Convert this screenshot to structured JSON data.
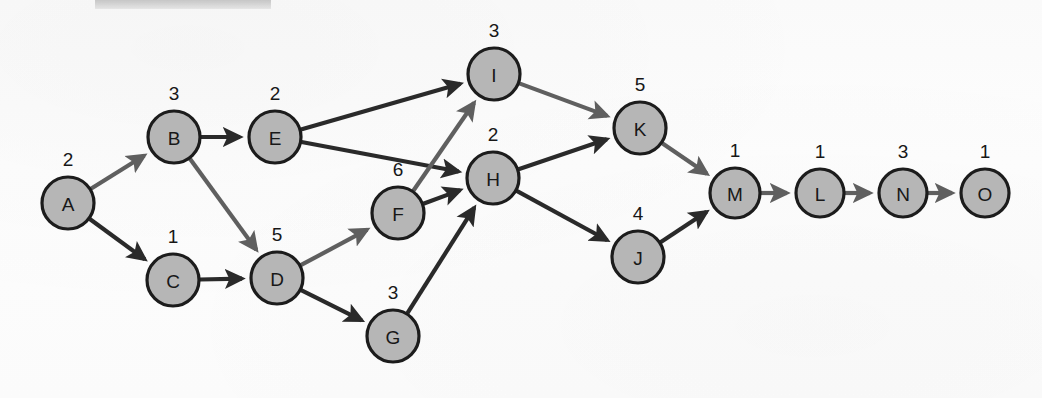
{
  "figure": {
    "background_color": "#fbfbfb",
    "node_fill_color": "#b6b6b6",
    "node_stroke_color": "#1c1c1c",
    "edge_color": "#2a2a2a",
    "edge_color_light": "#5f5f5f"
  },
  "chart_data": {
    "type": "diagram",
    "subtype": "directed-graph",
    "title": "",
    "nodes": [
      {
        "id": "A",
        "label": "A",
        "weight": "2",
        "x": 68,
        "y": 203,
        "r": 26
      },
      {
        "id": "B",
        "label": "B",
        "weight": "3",
        "x": 174,
        "y": 137,
        "r": 26
      },
      {
        "id": "C",
        "label": "C",
        "weight": "1",
        "x": 173,
        "y": 280,
        "r": 26
      },
      {
        "id": "D",
        "label": "D",
        "weight": "5",
        "x": 277,
        "y": 278,
        "r": 26
      },
      {
        "id": "E",
        "label": "E",
        "weight": "2",
        "x": 275,
        "y": 137,
        "r": 26
      },
      {
        "id": "F",
        "label": "F",
        "weight": "6",
        "x": 398,
        "y": 213,
        "r": 26
      },
      {
        "id": "G",
        "label": "G",
        "weight": "3",
        "x": 393,
        "y": 336,
        "r": 26
      },
      {
        "id": "H",
        "label": "H",
        "weight": "2",
        "x": 493,
        "y": 178,
        "r": 26
      },
      {
        "id": "I",
        "label": "I",
        "weight": "3",
        "x": 494,
        "y": 74,
        "r": 26
      },
      {
        "id": "J",
        "label": "J",
        "weight": "4",
        "x": 638,
        "y": 257,
        "r": 26
      },
      {
        "id": "K",
        "label": "K",
        "weight": "5",
        "x": 640,
        "y": 128,
        "r": 26
      },
      {
        "id": "L",
        "label": "L",
        "weight": "1",
        "x": 820,
        "y": 193,
        "r": 24
      },
      {
        "id": "M",
        "label": "M",
        "weight": "1",
        "x": 735,
        "y": 193,
        "r": 25
      },
      {
        "id": "N",
        "label": "N",
        "weight": "3",
        "x": 903,
        "y": 193,
        "r": 24
      },
      {
        "id": "O",
        "label": "O",
        "weight": "1",
        "x": 985,
        "y": 193,
        "r": 24
      }
    ],
    "edges": [
      {
        "from": "A",
        "to": "B",
        "style": "light"
      },
      {
        "from": "A",
        "to": "C",
        "style": "dark"
      },
      {
        "from": "B",
        "to": "E",
        "style": "dark"
      },
      {
        "from": "B",
        "to": "D",
        "style": "light"
      },
      {
        "from": "C",
        "to": "D",
        "style": "dark"
      },
      {
        "from": "D",
        "to": "F",
        "style": "light"
      },
      {
        "from": "D",
        "to": "G",
        "style": "dark"
      },
      {
        "from": "E",
        "to": "I",
        "style": "dark"
      },
      {
        "from": "E",
        "to": "H",
        "style": "dark"
      },
      {
        "from": "F",
        "to": "I",
        "style": "light"
      },
      {
        "from": "F",
        "to": "H",
        "style": "dark"
      },
      {
        "from": "G",
        "to": "H",
        "style": "dark"
      },
      {
        "from": "H",
        "to": "K",
        "style": "dark"
      },
      {
        "from": "H",
        "to": "J",
        "style": "dark"
      },
      {
        "from": "I",
        "to": "K",
        "style": "light"
      },
      {
        "from": "K",
        "to": "M",
        "style": "light"
      },
      {
        "from": "J",
        "to": "M",
        "style": "dark"
      },
      {
        "from": "M",
        "to": "L",
        "style": "light"
      },
      {
        "from": "L",
        "to": "N",
        "style": "light"
      },
      {
        "from": "N",
        "to": "O",
        "style": "light"
      }
    ],
    "node_weight_position": "above-node",
    "legend": [],
    "xlabel": "",
    "ylabel": ""
  }
}
